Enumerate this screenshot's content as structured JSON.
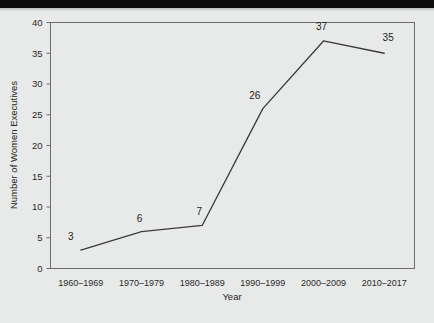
{
  "chart_data": {
    "type": "line",
    "title": "",
    "xlabel": "Year",
    "ylabel": "Number of Women Executives",
    "categories": [
      "1960–1969",
      "1970–1979",
      "1980–1989",
      "1990–1999",
      "2000–2009",
      "2010–2017"
    ],
    "values": [
      3,
      6,
      7,
      26,
      37,
      35
    ],
    "point_labels": [
      "3",
      "6",
      "7",
      "26",
      "37",
      "35"
    ],
    "ylim": [
      0,
      40
    ],
    "yticks": [
      0,
      5,
      10,
      15,
      20,
      25,
      30,
      35,
      40
    ],
    "ytick_labels": [
      "0",
      "5",
      "10",
      "15",
      "20",
      "25",
      "30",
      "35",
      "40"
    ],
    "grid": false,
    "legend": false,
    "line_color": "#3a3a3a",
    "frame_color": "#6c6c6c",
    "background_color": "#e8e9e9"
  }
}
